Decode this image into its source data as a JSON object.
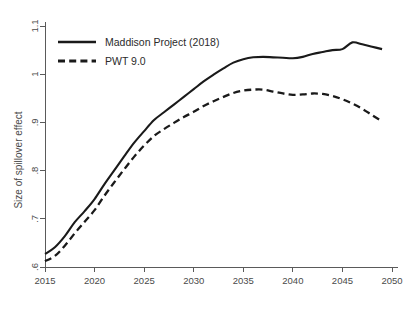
{
  "chart_data": {
    "type": "line",
    "title": "",
    "xlabel": "",
    "ylabel": "Size of spillover effect",
    "xlim": [
      2015,
      2050
    ],
    "ylim": [
      0.6,
      1.1
    ],
    "grid": false,
    "legend_position": "top-left",
    "xticks": [
      2015,
      2020,
      2025,
      2030,
      2035,
      2040,
      2045,
      2050
    ],
    "xtick_labels": [
      "2015",
      "2020",
      "2025",
      "2030",
      "2035",
      "2040",
      "2045",
      "2050"
    ],
    "yticks": [
      0.6,
      0.7,
      0.8,
      0.9,
      1.0,
      1.1
    ],
    "ytick_labels": [
      ".6",
      ".7",
      ".8",
      ".9",
      "1",
      "1.1"
    ],
    "x": [
      2015,
      2016,
      2017,
      2018,
      2019,
      2020,
      2021,
      2022,
      2023,
      2024,
      2025,
      2026,
      2027,
      2028,
      2029,
      2030,
      2031,
      2032,
      2033,
      2034,
      2035,
      2036,
      2037,
      2038,
      2039,
      2040,
      2041,
      2042,
      2043,
      2044,
      2045,
      2046,
      2047,
      2048,
      2049
    ],
    "series": [
      {
        "name": "Maddison Project (2018)",
        "style": "solid",
        "color": "#1a1a1a",
        "values": [
          0.627,
          0.641,
          0.664,
          0.693,
          0.716,
          0.741,
          0.772,
          0.801,
          0.83,
          0.858,
          0.882,
          0.905,
          0.921,
          0.937,
          0.953,
          0.969,
          0.985,
          0.999,
          1.012,
          1.024,
          1.031,
          1.035,
          1.036,
          1.035,
          1.034,
          1.033,
          1.036,
          1.042,
          1.046,
          1.05,
          1.052,
          1.066,
          1.062,
          1.057,
          1.052
        ]
      },
      {
        "name": "PWT 9.0",
        "style": "dashed",
        "color": "#1a1a1a",
        "values": [
          0.612,
          0.623,
          0.644,
          0.67,
          0.694,
          0.718,
          0.748,
          0.776,
          0.803,
          0.829,
          0.852,
          0.872,
          0.886,
          0.899,
          0.911,
          0.922,
          0.934,
          0.944,
          0.953,
          0.961,
          0.966,
          0.968,
          0.968,
          0.964,
          0.96,
          0.957,
          0.958,
          0.96,
          0.959,
          0.955,
          0.948,
          0.939,
          0.928,
          0.915,
          0.902
        ]
      }
    ]
  },
  "legend": {
    "entries": [
      {
        "label": "Maddison Project (2018)",
        "style": "solid"
      },
      {
        "label": "PWT 9.0",
        "style": "dashed"
      }
    ]
  },
  "axes": {
    "y_title": "Size of spillover effect"
  }
}
